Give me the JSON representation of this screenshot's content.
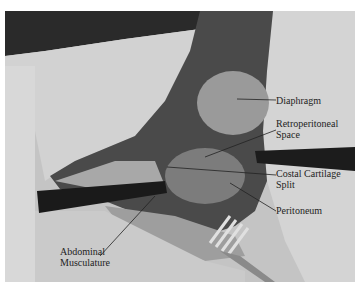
{
  "figure": {
    "labels": [
      {
        "id": "diaphragm",
        "text": "Diaphragm",
        "x": 276,
        "y": 95
      },
      {
        "id": "retroperitoneal",
        "line1": "Retroperitoneal",
        "line2": "Space",
        "x": 276,
        "y": 118
      },
      {
        "id": "costal",
        "line1": "Costal Cartilage",
        "line2": "Split",
        "x": 276,
        "y": 168
      },
      {
        "id": "peritoneum",
        "text": "Peritoneum",
        "x": 276,
        "y": 205
      },
      {
        "id": "abdominal",
        "line1": "Abdominal",
        "line2": "Musculature",
        "x": 60,
        "y": 246
      }
    ],
    "colors": {
      "background": "#ffffff",
      "drape": "#c8c8c8",
      "tissue_dark": "#3a3a3a",
      "instrument": "#1a1a1a"
    }
  }
}
